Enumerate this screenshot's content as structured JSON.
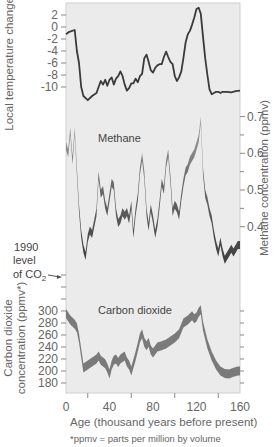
{
  "chart_data": {
    "type": "line",
    "title": "",
    "xlabel": "Age (thousand years before present)",
    "xlim": [
      0,
      160
    ],
    "x_ticks": [
      0,
      40,
      80,
      120,
      160
    ],
    "x_minor_ticks": [
      20,
      60,
      100,
      140
    ],
    "grid": false,
    "panels": [
      {
        "name": "Temperature",
        "ylabel": "Local temperature change (°C)",
        "axis_side": "left",
        "y_ticks": [
          2,
          0,
          -2,
          -4,
          -6,
          -8,
          -10
        ],
        "series": [
          {
            "name": "Local temperature change",
            "style": "line",
            "x": [
              0,
              3,
              8,
              10,
              12,
              14,
              16,
              20,
              24,
              28,
              30,
              32,
              34,
              36,
              38,
              40,
              42,
              44,
              46,
              48,
              50,
              52,
              54,
              56,
              58,
              60,
              62,
              64,
              66,
              68,
              70,
              72,
              74,
              76,
              78,
              80,
              82,
              84,
              86,
              88,
              90,
              92,
              94,
              96,
              98,
              100,
              102,
              104,
              106,
              108,
              110,
              112,
              114,
              116,
              118,
              120,
              122,
              124,
              126,
              128,
              130,
              132,
              134,
              136,
              138,
              140,
              142,
              144,
              148,
              152,
              156,
              160
            ],
            "values": [
              -1.2,
              -0.8,
              -0.5,
              -4,
              -6,
              -10,
              -11.5,
              -12.2,
              -11.5,
              -11,
              -10,
              -9,
              -9.6,
              -8.8,
              -9.8,
              -8.8,
              -8.4,
              -9.6,
              -8.6,
              -8.2,
              -7.4,
              -8.2,
              -9.6,
              -10.6,
              -10.2,
              -9.4,
              -9.4,
              -8.6,
              -9.2,
              -8.2,
              -7.8,
              -5.2,
              -4.6,
              -5.8,
              -7.2,
              -7.6,
              -6.8,
              -6.4,
              -6.2,
              -6.2,
              -5.0,
              -4.1,
              -5.0,
              -5.8,
              -6.2,
              -8.2,
              -9.0,
              -8.4,
              -7.4,
              -5.2,
              -2.6,
              -1.2,
              -0.6,
              0.4,
              1.6,
              3.0,
              3.2,
              2.2,
              -1.6,
              -5.2,
              -8.0,
              -10.4,
              -11.2,
              -11.0,
              -10.8,
              -10.8,
              -11.0,
              -10.8,
              -10.8,
              -10.9,
              -10.7,
              -10.6
            ]
          }
        ]
      },
      {
        "name": "Methane",
        "label": "Methane",
        "ylabel": "Methane concentration (ppmv)",
        "axis_side": "right",
        "y_ticks": [
          0.7,
          0.6,
          0.5,
          0.4
        ],
        "series": [
          {
            "name": "Methane concentration",
            "style": "band",
            "x": [
              0,
              2,
              4,
              6,
              8,
              10,
              12,
              14,
              16,
              18,
              20,
              22,
              24,
              26,
              28,
              30,
              32,
              34,
              36,
              38,
              40,
              42,
              44,
              46,
              48,
              50,
              52,
              54,
              56,
              58,
              60,
              62,
              64,
              66,
              68,
              70,
              72,
              74,
              76,
              78,
              80,
              82,
              84,
              86,
              88,
              90,
              92,
              94,
              96,
              98,
              100,
              102,
              104,
              106,
              108,
              110,
              112,
              114,
              116,
              118,
              120,
              122,
              124,
              126,
              128,
              130,
              132,
              134,
              136,
              138,
              140,
              142,
              144,
              146,
              148,
              150,
              152,
              154,
              156,
              158,
              160
            ],
            "values": [
              0.62,
              0.6,
              0.66,
              0.58,
              0.66,
              0.55,
              0.45,
              0.38,
              0.34,
              0.32,
              0.37,
              0.39,
              0.38,
              0.41,
              0.44,
              0.54,
              0.49,
              0.5,
              0.46,
              0.44,
              0.48,
              0.52,
              0.51,
              0.44,
              0.41,
              0.42,
              0.44,
              0.43,
              0.44,
              0.42,
              0.46,
              0.38,
              0.44,
              0.48,
              0.55,
              0.59,
              0.54,
              0.44,
              0.4,
              0.45,
              0.42,
              0.38,
              0.41,
              0.46,
              0.52,
              0.5,
              0.57,
              0.6,
              0.53,
              0.44,
              0.46,
              0.45,
              0.43,
              0.48,
              0.52,
              0.55,
              0.56,
              0.58,
              0.59,
              0.6,
              0.62,
              0.64,
              0.69,
              0.55,
              0.49,
              0.47,
              0.44,
              0.42,
              0.38,
              0.35,
              0.33,
              0.36,
              0.33,
              0.31,
              0.32,
              0.33,
              0.34,
              0.33,
              0.34,
              0.35,
              0.35
            ],
            "band_width": 0.03
          }
        ]
      },
      {
        "name": "Carbon dioxide",
        "label": "Carbon dioxide",
        "ylabel": "Carbon dioxide concentration (ppmv*)",
        "axis_side": "left",
        "y_ticks": [
          300,
          280,
          260,
          240,
          220,
          200,
          180
        ],
        "annotation": {
          "text_lines": [
            "1990",
            "level",
            "of CO₂"
          ],
          "value": 357
        },
        "series": [
          {
            "name": "CO2 concentration",
            "style": "band",
            "x": [
              0,
              4,
              8,
              10,
              12,
              14,
              16,
              20,
              24,
              28,
              30,
              32,
              36,
              38,
              40,
              42,
              44,
              46,
              48,
              50,
              54,
              56,
              58,
              60,
              62,
              64,
              66,
              68,
              70,
              72,
              74,
              76,
              78,
              80,
              84,
              88,
              92,
              96,
              100,
              104,
              108,
              112,
              116,
              118,
              120,
              122,
              124,
              126,
              128,
              130,
              134,
              138,
              142,
              146,
              150,
              154,
              158,
              160
            ],
            "values": [
              296,
              285,
              278,
              272,
              255,
              230,
              205,
              210,
              215,
              220,
              225,
              218,
              212,
              205,
              195,
              210,
              218,
              220,
              214,
              220,
              225,
              215,
              210,
              200,
              212,
              225,
              240,
              255,
              262,
              248,
              242,
              248,
              235,
              230,
              240,
              242,
              245,
              250,
              255,
              262,
              280,
              285,
              292,
              287,
              290,
              298,
              302,
              275,
              260,
              245,
              225,
              210,
              200,
              196,
              195,
              198,
              200,
              200
            ],
            "band_width": 12
          }
        ]
      }
    ],
    "footnote": "*ppmv = parts per million by volume"
  },
  "labels": {
    "temp_axis_title": "Local temperature change (°C)",
    "methane_axis_title": "Methane concentration (ppmv)",
    "co2_axis_title_line1": "Carbon dioxide",
    "co2_axis_title_line2": "concentration (ppmv*)",
    "methane_label": "Methane",
    "co2_label": "Carbon dioxide",
    "x_axis_title": "Age (thousand years before present)",
    "co2_1990_line1": "1990",
    "co2_1990_line2": "level",
    "co2_1990_line3": "of CO",
    "co2_1990_sub": "2",
    "footnote": "*ppmv = parts per million by volume"
  },
  "colors": {
    "plot_bg": "#ebebeb",
    "temp_line": "#3a3a3a",
    "methane_dark": "#4a4a4a",
    "methane_light": "#9a9a9a",
    "co2_band": "#7a7a7a",
    "axis": "#888888"
  }
}
